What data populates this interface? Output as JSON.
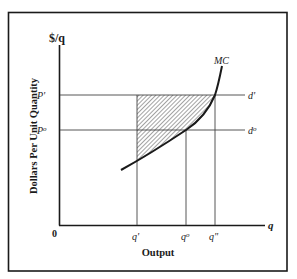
{
  "figure": {
    "type": "economics-diagram",
    "y_axis_unit": "$/q",
    "y_axis_title": "Dollars Per Unit Quantity",
    "x_axis_unit": "q",
    "x_axis_title": "Output",
    "origin_label": "0",
    "price_labels": {
      "p_prime": "P'",
      "p_zero": "P",
      "p_zero_sup": "o"
    },
    "demand_labels": {
      "d_prime": "d'",
      "d_zero": "d",
      "d_zero_sup": "o"
    },
    "quantity_labels": {
      "q_prime": "q'",
      "q_zero": "q",
      "q_zero_sup": "o",
      "q_double": "q\""
    },
    "curve_label": "MC",
    "colors": {
      "ink": "#1a1a1a",
      "thin": "#444444",
      "background": "#ffffff"
    }
  }
}
